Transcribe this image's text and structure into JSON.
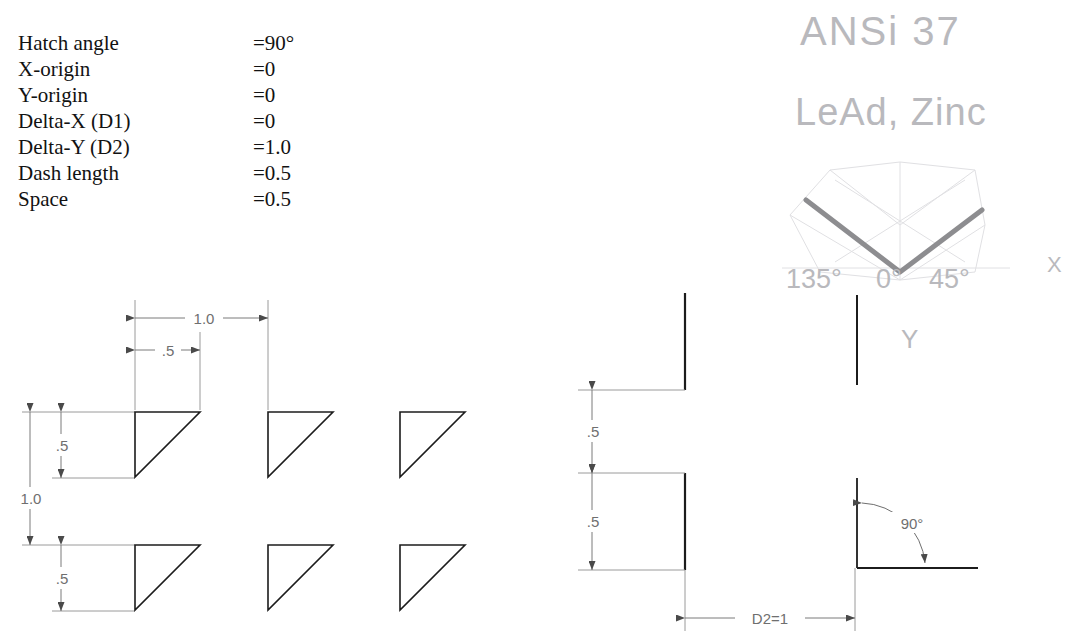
{
  "parameters": {
    "rows": [
      {
        "label": "Hatch angle",
        "value": "=90°"
      },
      {
        "label": "X-origin",
        "value": "=0"
      },
      {
        "label": "Y-origin",
        "value": "=0"
      },
      {
        "label": "Delta-X (D1)",
        "value": "=0"
      },
      {
        "label": "Delta-Y (D2)",
        "value": "=1.0"
      },
      {
        "label": "Dash length",
        "value": "=0.5"
      },
      {
        "label": "Space",
        "value": "=0.5"
      }
    ]
  },
  "pattern_grid": {
    "dim_top_full": "1.0",
    "dim_top_half": ".5",
    "dim_left_full": "1.0",
    "dim_left_upper": ".5",
    "dim_left_lower": ".5"
  },
  "dash_diagram": {
    "dim_dash": ".5",
    "dim_space": ".5",
    "dim_d2": "D2=1"
  },
  "angle_diagram": {
    "angle_label": "90°"
  },
  "handwriting": {
    "line1": "ANSi 37",
    "line2": "LeAd, Zinc",
    "angle_left": "135°",
    "angle_center": "0°",
    "angle_right": "45°",
    "axis_x": "X",
    "axis_y": "Y"
  },
  "colors": {
    "line": "#1c1c1c",
    "dim_line": "#7a7a7a",
    "dim_text": "#6f6f6f",
    "pencil": "#c3c3c7",
    "pencil_dark": "#8d8d90",
    "background": "#ffffff"
  }
}
